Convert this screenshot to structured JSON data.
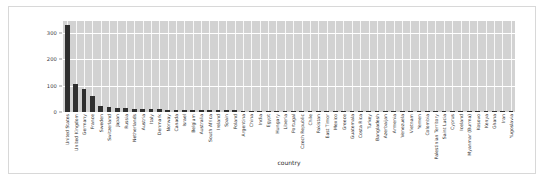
{
  "chart_data": {
    "type": "bar",
    "title": "",
    "xlabel": "country",
    "ylabel": "",
    "ylim": [
      0,
      345
    ],
    "yticks": [
      0,
      100,
      200,
      300
    ],
    "ytick_labels": [
      "0",
      "100",
      "200",
      "300"
    ],
    "grid": true,
    "legend": null,
    "orientation": "vertical",
    "bar_color": "#2f2f2f",
    "plot_background": "#d2d2d2",
    "gridline_color": "#ffffff",
    "categories": [
      "United States",
      "United Kingdom",
      "Germany",
      "France",
      "Sweden",
      "Switzerland",
      "Japan",
      "Russia",
      "Netherlands",
      "Austria",
      "Italy",
      "Denmark",
      "Norway",
      "Canada",
      "Israel",
      "Belgium",
      "Australia",
      "South Africa",
      "Ireland",
      "Spain",
      "Poland",
      "Argentina",
      "China",
      "India",
      "Egypt",
      "Hungary",
      "Liberia",
      "Portugal",
      "Czech Republic",
      "Chile",
      "Pakistan",
      "East Timor",
      "Mexico",
      "Greece",
      "Guatemala",
      "Costa Rica",
      "Turkey",
      "Bangladesh",
      "Azerbaijan",
      "Armenia",
      "Venezuela",
      "Vietnam",
      "Yemen",
      "Colombia",
      "Palestinian Territory",
      "Saint Lucia",
      "Cyprus",
      "Iceland",
      "Myanmar (Burma)",
      "Kosovo",
      "Kenya",
      "Ghana",
      "Iran",
      "Yugoslavia"
    ],
    "values": [
      330,
      105,
      86,
      60,
      22,
      19,
      17,
      15,
      13,
      12,
      11,
      10,
      9,
      9,
      8,
      8,
      7,
      7,
      6,
      6,
      6,
      5,
      5,
      5,
      4,
      4,
      4,
      4,
      3,
      3,
      3,
      3,
      3,
      3,
      2,
      2,
      2,
      2,
      2,
      2,
      2,
      2,
      2,
      1,
      1,
      1,
      1,
      1,
      1,
      1,
      1,
      1,
      1,
      1
    ]
  },
  "axis": {
    "x_title": "country"
  }
}
